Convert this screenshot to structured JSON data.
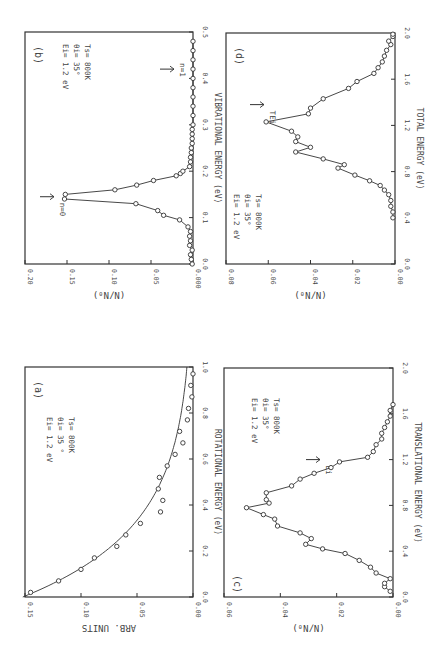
{
  "figure": {
    "orientation_note_hidden": null
  },
  "chart_data": [
    {
      "id": "b",
      "panel_label": "(b)",
      "type": "line",
      "title": "",
      "xlabel": "VIBRATIONAL ENERGY (eV)",
      "ylabel": "(N/N₀)",
      "xlim": [
        0.0,
        0.5
      ],
      "ylim": [
        0.0,
        0.2
      ],
      "xticks": [
        "0.0",
        "0.1",
        "0.2",
        "0.3",
        "0.4",
        "0.5"
      ],
      "xtick_values": [
        0.0,
        0.1,
        0.2,
        0.3,
        0.4,
        0.5
      ],
      "yticks": [
        "0.20",
        "0.15",
        "0.10",
        "0.05",
        "0.000"
      ],
      "ytick_values": [
        0.2,
        0.15,
        0.1,
        0.05,
        0.0
      ],
      "annotation_lines": [
        "Ei= 1.2 eV",
        "θi= 35°",
        "Ts= 800K"
      ],
      "arrows": [
        {
          "label": "n=0",
          "x": 0.145
        },
        {
          "label": "n=1",
          "x": 0.42
        }
      ],
      "frame": {
        "left": 25,
        "right": 193,
        "top": 32,
        "bottom": 264
      },
      "connected": true,
      "x": [
        0.0,
        0.01,
        0.02,
        0.03,
        0.04,
        0.05,
        0.06,
        0.07,
        0.08,
        0.095,
        0.105,
        0.115,
        0.13,
        0.14,
        0.15,
        0.16,
        0.17,
        0.18,
        0.19,
        0.195,
        0.2,
        0.21,
        0.22,
        0.23,
        0.24,
        0.25,
        0.26,
        0.27,
        0.28,
        0.29,
        0.3,
        0.32,
        0.34,
        0.36,
        0.38,
        0.4,
        0.42,
        0.44,
        0.46,
        0.48
      ],
      "y": [
        0.001,
        0.002,
        0.003,
        0.001,
        0.004,
        0.003,
        0.004,
        0.003,
        0.006,
        0.016,
        0.035,
        0.042,
        0.068,
        0.153,
        0.152,
        0.093,
        0.067,
        0.047,
        0.02,
        0.015,
        0.012,
        0.004,
        0.003,
        0.003,
        0.002,
        0.002,
        0.001,
        0.001,
        0.001,
        0.001,
        0.0,
        0.0,
        0.0,
        0.0,
        0.0,
        0.0,
        0.0,
        0.0,
        0.0,
        0.0
      ]
    },
    {
      "id": "d",
      "panel_label": "(d)",
      "type": "line",
      "title": "",
      "xlabel": "TOTAL ENERGY (eV)",
      "ylabel": "(N/N₀)",
      "xlim": [
        0.0,
        2.0
      ],
      "ylim": [
        0.0,
        0.08
      ],
      "xticks": [
        "0.0",
        "0.4",
        "0.8",
        "1.2",
        "1.6",
        "2.0"
      ],
      "xtick_values": [
        0.0,
        0.4,
        0.8,
        1.2,
        1.6,
        2.0
      ],
      "yticks": [
        "0.08",
        "0.06",
        "0.04",
        "0.02",
        "0.00"
      ],
      "ytick_values": [
        0.08,
        0.06,
        0.04,
        0.02,
        0.0
      ],
      "annotation_lines": [
        "Ei= 1.2 eV",
        "θi= 35°",
        "Ts= 800K"
      ],
      "arrows": [
        {
          "label": "TEi",
          "x": 1.38
        }
      ],
      "frame": {
        "left": 226,
        "right": 395,
        "top": 33,
        "bottom": 264
      },
      "connected": true,
      "x": [
        0.4,
        0.45,
        0.5,
        0.55,
        0.6,
        0.64,
        0.68,
        0.72,
        0.77,
        0.83,
        0.86,
        0.91,
        0.97,
        1.01,
        1.06,
        1.1,
        1.15,
        1.23,
        1.3,
        1.35,
        1.43,
        1.52,
        1.58,
        1.65,
        1.7,
        1.75,
        1.8,
        1.85,
        1.9,
        1.93,
        1.97,
        1.99
      ],
      "y": [
        0.001,
        0.001,
        0.002,
        0.002,
        0.003,
        0.005,
        0.007,
        0.012,
        0.019,
        0.027,
        0.024,
        0.034,
        0.047,
        0.04,
        0.047,
        0.046,
        0.049,
        0.061,
        0.041,
        0.04,
        0.034,
        0.022,
        0.018,
        0.01,
        0.008,
        0.006,
        0.005,
        0.004,
        0.002,
        0.003,
        0.001,
        0.001
      ]
    },
    {
      "id": "a",
      "panel_label": "(a)",
      "type": "scatter",
      "title": "",
      "xlabel": "ROTATIONAL ENERGY (eV)",
      "ylabel": "ARB. UNITS",
      "xlim": [
        0.0,
        1.0
      ],
      "ylim": [
        0.0,
        0.15
      ],
      "xticks": [
        "0.0",
        "0.2",
        "0.4",
        "0.6",
        "0.8",
        "1.0"
      ],
      "xtick_values": [
        0.0,
        0.2,
        0.4,
        0.6,
        0.8,
        1.0
      ],
      "yticks": [
        "0.15",
        "0.10",
        "0.05",
        "0.00"
      ],
      "ytick_values": [
        0.15,
        0.1,
        0.05,
        0.0
      ],
      "annotation_lines": [
        "Ei= 1.2 eV",
        "θi= 35 °",
        "Ts= 800K"
      ],
      "arrows": [],
      "frame": {
        "left": 25,
        "right": 193,
        "top": 367,
        "bottom": 597
      },
      "connected": false,
      "fit_curve": {
        "form": "exponential",
        "amplitude": 0.152,
        "decay_eV": 0.3
      },
      "x": [
        0.02,
        0.07,
        0.12,
        0.17,
        0.22,
        0.27,
        0.32,
        0.37,
        0.42,
        0.47,
        0.52,
        0.57,
        0.62,
        0.67,
        0.72,
        0.77,
        0.82,
        0.87,
        0.92,
        0.97
      ],
      "y": [
        0.145,
        0.12,
        0.1,
        0.088,
        0.068,
        0.06,
        0.047,
        0.029,
        0.027,
        0.031,
        0.03,
        0.023,
        0.016,
        0.009,
        0.012,
        0.005,
        0.004,
        0.001,
        0.002,
        0.0
      ]
    },
    {
      "id": "c",
      "panel_label": "(c)",
      "type": "line",
      "title": "",
      "xlabel": "TRANSLATIONAL ENERGY (eV)",
      "ylabel": "(N/N₀)",
      "xlim": [
        0.0,
        2.0
      ],
      "ylim": [
        0.0,
        0.06
      ],
      "xticks": [
        "0.0",
        "0.4",
        "0.8",
        "1.2",
        "1.6",
        "2.0"
      ],
      "xtick_values": [
        0.0,
        0.4,
        0.8,
        1.2,
        1.6,
        2.0
      ],
      "yticks": [
        "0.06",
        "0.04",
        "0.02",
        "0.00"
      ],
      "ytick_values": [
        0.06,
        0.04,
        0.02,
        0.0
      ],
      "annotation_lines": [
        "Ei= 1.2 eV",
        "θi= 35°",
        "Ts= 800K"
      ],
      "arrows": [
        {
          "label": "Ei",
          "x": 1.2
        }
      ],
      "frame": {
        "left": 224,
        "right": 393,
        "top": 368,
        "bottom": 597
      },
      "connected": true,
      "x": [
        0.05,
        0.09,
        0.12,
        0.16,
        0.21,
        0.26,
        0.32,
        0.38,
        0.42,
        0.46,
        0.51,
        0.56,
        0.62,
        0.68,
        0.72,
        0.78,
        0.82,
        0.85,
        0.91,
        0.97,
        1.03,
        1.08,
        1.13,
        1.18,
        1.22,
        1.27,
        1.33,
        1.38,
        1.43,
        1.48,
        1.53,
        1.58,
        1.63,
        1.68
      ],
      "y": [
        0.001,
        0.003,
        0.003,
        0.001,
        0.006,
        0.008,
        0.012,
        0.017,
        0.025,
        0.031,
        0.029,
        0.033,
        0.041,
        0.042,
        0.046,
        0.052,
        0.044,
        0.045,
        0.045,
        0.036,
        0.033,
        0.028,
        0.022,
        0.019,
        0.009,
        0.007,
        0.006,
        0.004,
        0.004,
        0.003,
        0.002,
        0.001,
        0.001,
        0.0
      ]
    }
  ]
}
